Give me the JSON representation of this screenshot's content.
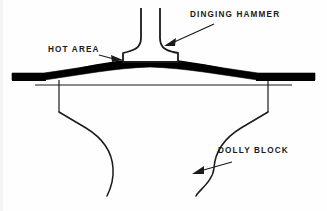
{
  "figure": {
    "type": "technical-cross-section-diagram",
    "background_color": "#fefefe",
    "line_color": "#1a1a1a",
    "fill_color": "#000000"
  },
  "labels": {
    "dinging_hammer": "DINGING HAMMER",
    "hot_area": "HOT AREA",
    "dolly_block": "DOLLY BLOCK"
  },
  "annotations": [
    {
      "name": "dinging-hammer-leader",
      "text": "DINGING HAMMER",
      "arrow_from": [
        214,
        24
      ],
      "arrow_to": [
        166,
        45
      ],
      "direction": "down-left"
    },
    {
      "name": "hot-area-leader",
      "text": "HOT AREA",
      "arrow_from": [
        100,
        55
      ],
      "arrow_to": [
        122,
        59
      ],
      "direction": "right"
    },
    {
      "name": "dolly-block-leader",
      "text": "DOLLY BLOCK",
      "arrow_from": [
        232,
        162
      ],
      "arrow_to": [
        193,
        173
      ],
      "direction": "down-left"
    }
  ],
  "parts": {
    "hammer": {
      "name": "dinging-hammer",
      "description": "T-shaped hammer with vertical shaft, concave fillets and flat striking face",
      "shaft_left_x": 141,
      "shaft_right_x": 160,
      "shaft_top_y": 8,
      "head_left_x": 123,
      "head_right_x": 178,
      "head_top_y": 55,
      "head_bottom_y": 62
    },
    "panel": {
      "name": "metal-panel",
      "description": "Thick black sheet-metal section, flat at both ends, bulged upward in the center (hot area)",
      "left_end_x": 12,
      "right_end_x": 315,
      "flat_level_y": 75,
      "apex_y": 62,
      "thickness": 6
    },
    "dolly_block": {
      "name": "dolly-block",
      "description": "Backing block under the panel with vertical sides, angled shoulders and S-curved tapering body",
      "top_line_y": 85,
      "left_side_x": 59,
      "right_side_x": 268,
      "shoulder_y": 112,
      "bottom_left_x": 107,
      "bottom_right_x": 196,
      "bottom_y": 196
    }
  }
}
